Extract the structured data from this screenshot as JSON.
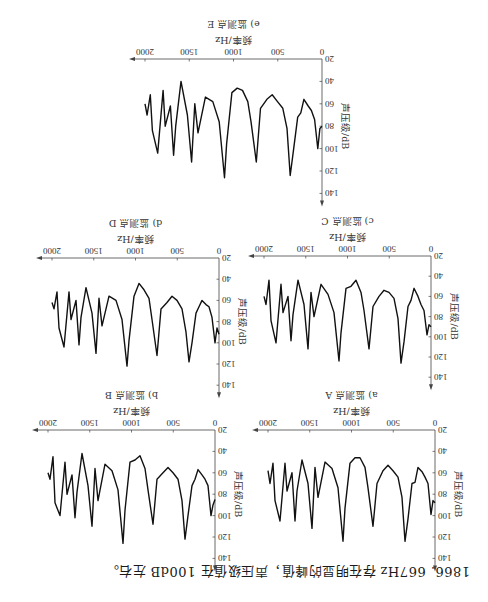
{
  "caption": "1866. 667Hz 存在明显的峰值，声压级值在 100dB 左右。",
  "orientation": "rotated-180",
  "chart_data": [
    {
      "id": "A",
      "type": "line",
      "title": "a) 监测点 A",
      "xlabel": "频率/Hz",
      "ylabel": "声压级/dB",
      "xlim": [
        0,
        2000
      ],
      "ylim": [
        20,
        140
      ],
      "xticks": [
        0,
        500,
        1000,
        1500,
        2000
      ],
      "yticks": [
        20,
        40,
        60,
        80,
        100,
        120,
        140
      ],
      "grid": false,
      "x": [
        0,
        24,
        48,
        84,
        120,
        156,
        204,
        240,
        275,
        323,
        359,
        395,
        443,
        503,
        563,
        623,
        695,
        742,
        802,
        838,
        898,
        958,
        1018,
        1078,
        1102,
        1162,
        1234,
        1317,
        1401,
        1437,
        1473,
        1521,
        1593,
        1653,
        1677,
        1713,
        1772,
        1796,
        1856,
        1916,
        1940,
        1976,
        2000
      ],
      "y": [
        88,
        86,
        99,
        70,
        64,
        59,
        55,
        69,
        70,
        103,
        124,
        83,
        64,
        58,
        53,
        58,
        70,
        110,
        74,
        55,
        46,
        46,
        51,
        93,
        124,
        74,
        56,
        50,
        83,
        55,
        112,
        70,
        48,
        77,
        105,
        60,
        77,
        51,
        105,
        86,
        51,
        70,
        58
      ]
    },
    {
      "id": "B",
      "type": "line",
      "title": "b) 监测点 B",
      "xlabel": "频率/Hz",
      "ylabel": "声压级/dB",
      "xlim": [
        0,
        2000
      ],
      "ylim": [
        20,
        140
      ],
      "xticks": [
        0,
        500,
        1000,
        1500,
        2000
      ],
      "yticks": [
        20,
        40,
        60,
        80,
        100,
        120,
        140
      ],
      "grid": false,
      "x": [
        0,
        24,
        48,
        84,
        120,
        156,
        204,
        240,
        275,
        323,
        359,
        395,
        443,
        503,
        563,
        623,
        695,
        742,
        802,
        838,
        898,
        958,
        1018,
        1078,
        1102,
        1162,
        1234,
        1317,
        1401,
        1437,
        1473,
        1521,
        1593,
        1653,
        1677,
        1713,
        1772,
        1796,
        1856,
        1916,
        1940,
        1976,
        2000
      ],
      "y": [
        85,
        90,
        100,
        72,
        66,
        62,
        57,
        66,
        72,
        100,
        122,
        86,
        66,
        60,
        55,
        60,
        66,
        108,
        76,
        56,
        44,
        48,
        50,
        95,
        126,
        76,
        58,
        52,
        86,
        56,
        110,
        72,
        42,
        78,
        102,
        62,
        80,
        50,
        100,
        88,
        45,
        66,
        60
      ]
    },
    {
      "id": "C",
      "type": "line",
      "title": "c) 监测点 C",
      "xlabel": "频率/Hz",
      "ylabel": "声压级/dB",
      "xlim": [
        0,
        2000
      ],
      "ylim": [
        20,
        140
      ],
      "xticks": [
        0,
        500,
        1000,
        1500,
        2000
      ],
      "yticks": [
        20,
        40,
        60,
        80,
        100,
        120,
        140
      ],
      "grid": false,
      "x": [
        0,
        24,
        48,
        84,
        120,
        156,
        204,
        240,
        275,
        323,
        359,
        395,
        443,
        503,
        563,
        623,
        695,
        742,
        802,
        838,
        898,
        958,
        1018,
        1078,
        1102,
        1162,
        1234,
        1317,
        1401,
        1437,
        1473,
        1521,
        1593,
        1653,
        1677,
        1713,
        1772,
        1796,
        1856,
        1916,
        1940,
        1976,
        2000
      ],
      "y": [
        90,
        88,
        98,
        74,
        68,
        60,
        52,
        64,
        70,
        105,
        126,
        82,
        62,
        56,
        54,
        60,
        70,
        112,
        74,
        56,
        44,
        50,
        52,
        96,
        124,
        76,
        58,
        48,
        80,
        56,
        112,
        68,
        44,
        78,
        104,
        60,
        76,
        48,
        106,
        84,
        44,
        68,
        60
      ]
    },
    {
      "id": "D",
      "type": "line",
      "title": "d) 监测点 D",
      "xlabel": "频率/Hz",
      "ylabel": "声压级/dB",
      "xlim": [
        0,
        2000
      ],
      "ylim": [
        20,
        140
      ],
      "xticks": [
        0,
        500,
        1000,
        1500,
        2000
      ],
      "yticks": [
        20,
        40,
        60,
        80,
        100,
        120,
        140
      ],
      "grid": false,
      "x": [
        0,
        24,
        48,
        84,
        120,
        156,
        204,
        240,
        275,
        323,
        359,
        395,
        443,
        503,
        563,
        623,
        695,
        742,
        802,
        838,
        898,
        958,
        1018,
        1078,
        1102,
        1162,
        1234,
        1317,
        1401,
        1437,
        1473,
        1521,
        1593,
        1653,
        1677,
        1713,
        1772,
        1796,
        1856,
        1916,
        1940,
        1976,
        2000
      ],
      "y": [
        92,
        86,
        100,
        76,
        66,
        64,
        60,
        66,
        72,
        100,
        118,
        90,
        68,
        60,
        56,
        62,
        68,
        112,
        78,
        58,
        50,
        44,
        56,
        98,
        122,
        78,
        60,
        56,
        84,
        58,
        110,
        72,
        48,
        76,
        102,
        60,
        78,
        52,
        104,
        86,
        52,
        68,
        62
      ]
    },
    {
      "id": "E",
      "type": "line",
      "title": "e) 监测点 E",
      "xlabel": "频率/Hz",
      "ylabel": "声压级/dB",
      "xlim": [
        0,
        2000
      ],
      "ylim": [
        20,
        140
      ],
      "xticks": [
        0,
        500,
        1000,
        1500,
        2000
      ],
      "yticks": [
        20,
        40,
        60,
        80,
        100,
        120,
        140
      ],
      "grid": false,
      "x": [
        0,
        24,
        48,
        84,
        120,
        156,
        204,
        240,
        275,
        323,
        359,
        395,
        443,
        503,
        563,
        623,
        695,
        742,
        802,
        838,
        898,
        958,
        1018,
        1078,
        1102,
        1162,
        1234,
        1317,
        1401,
        1437,
        1473,
        1521,
        1593,
        1653,
        1677,
        1713,
        1772,
        1796,
        1856,
        1916,
        1940,
        1976,
        2000
      ],
      "y": [
        80,
        82,
        100,
        74,
        66,
        62,
        56,
        68,
        72,
        102,
        124,
        82,
        64,
        58,
        52,
        56,
        64,
        112,
        76,
        58,
        48,
        46,
        50,
        96,
        126,
        76,
        58,
        54,
        86,
        60,
        112,
        70,
        40,
        80,
        106,
        62,
        80,
        48,
        104,
        84,
        52,
        70,
        60
      ]
    }
  ],
  "layout": {
    "panels": [
      {
        "id": "A",
        "ox": 53,
        "oy": 172,
        "pxPerHz": 0.0835,
        "pxPerDb": 1.07
      },
      {
        "id": "B",
        "ox": 273,
        "oy": 172,
        "pxPerHz": 0.0835,
        "pxPerDb": 1.07
      },
      {
        "id": "C",
        "ox": 57,
        "oy": 346,
        "pxPerHz": 0.0835,
        "pxPerDb": 1.01
      },
      {
        "id": "D",
        "ox": 269,
        "oy": 344,
        "pxPerHz": 0.0835,
        "pxPerDb": 1.06
      },
      {
        "id": "E",
        "ox": 166,
        "oy": 543,
        "pxPerHz": 0.0885,
        "pxPerDb": 1.12
      }
    ],
    "line_color": "#111111",
    "axis_color": "#444444"
  }
}
